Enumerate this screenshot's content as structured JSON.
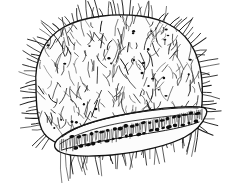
{
  "figure": {
    "domain_label": "Natural-Image",
    "title": "Hairy rounded organism with striated ventral band",
    "subject_name": "setose-body-specimen",
    "medium": "ink line drawing",
    "background_color": "#ffffff",
    "ink_color": "#1a1a1a",
    "fill_color": "#fdfdfd",
    "canvas": {
      "width": 235,
      "height": 183
    },
    "parts": [
      {
        "id": "body-outline",
        "label": "body outline",
        "description": "rounded quadrangular body margin"
      },
      {
        "id": "body-pelage",
        "label": "dense setae field",
        "description": "interior filled with short curved hair strokes"
      },
      {
        "id": "body-punctae",
        "label": "dark punctations",
        "description": "small dark dots scattered over body surface"
      },
      {
        "id": "marginal-setae",
        "label": "marginal setae",
        "description": "long hairs radiating outward from margin"
      },
      {
        "id": "ventral-band",
        "label": "striated ventral band",
        "description": "elongate band at lower body with transverse striae"
      },
      {
        "id": "spot-row-upper",
        "label": "upper spot row",
        "description": "row of dark oval spots inside band"
      },
      {
        "id": "spot-row-lower",
        "label": "lower spot row",
        "description": "second row of dark oval spots inside band"
      },
      {
        "id": "ventral-fringe",
        "label": "ventral fringe",
        "description": "long hairs hanging below the band"
      }
    ],
    "geometry": {
      "outline_path": "M 36 86 C 34 60 44 38 64 27 C 84 16 116 13 140 16 C 166 19 185 31 194 50 C 202 66 203 88 202 104 C 201 116 198 124 193 130 C 186 138 170 143 150 146 C 126 149 96 150 74 147 C 58 145 47 140 42 130 C 37 119 36 102 36 86 Z",
      "band_outer_path": "M 57 140 C 70 127 98 119 132 113 C 160 108 185 106 200 107 C 206 107 208 110 206 115 C 203 123 196 131 185 137 C 170 145 142 152 112 155 C 88 157 68 156 60 152 C 54 149 53 145 57 140 Z",
      "band_stripe_upper": "M 62 137 C 76 126 102 118 134 113 C 160 109 183 107 198 108",
      "band_stripe_mid": "M 60 144 C 74 134 100 126 132 121 C 160 117 184 114 201 114",
      "band_stripe_lower": "M 62 150 C 78 145 106 140 138 135 C 164 131 186 127 199 122",
      "spot_row_upper_baseline": {
        "x1": 70,
        "y1": 138,
        "x2": 200,
        "y2": 112
      },
      "spot_row_lower_baseline": {
        "x1": 72,
        "y1": 148,
        "x2": 198,
        "y2": 121
      },
      "upper_spot_count": 22,
      "lower_spot_count": 20,
      "punctae_count": 34,
      "interior_hair_count": 330,
      "marginal_hair_count": 120,
      "fringe_hair_count": 46
    },
    "annotations": {
      "has_text_labels": false,
      "has_scale_bar": false,
      "has_axis": false,
      "visible_text": ""
    }
  }
}
